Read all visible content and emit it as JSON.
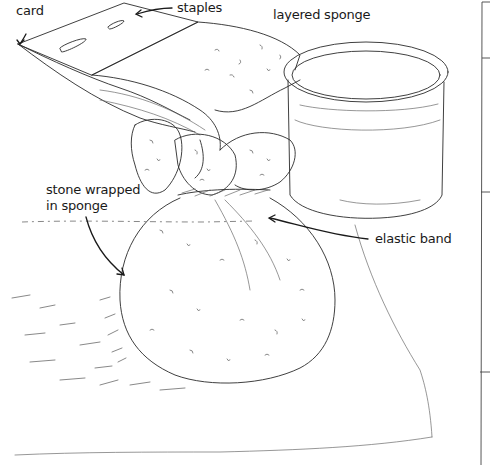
{
  "illustration": {
    "subject": "sponge-wrapped stone with card and jar",
    "labels": {
      "card": "card",
      "staples": "staples",
      "layered_sponge": "layered sponge",
      "stone_wrapped": "stone wrapped\nin sponge",
      "elastic_band": "elastic band"
    },
    "colors": {
      "ink": "#2a2a2a",
      "background": "#ffffff"
    }
  }
}
